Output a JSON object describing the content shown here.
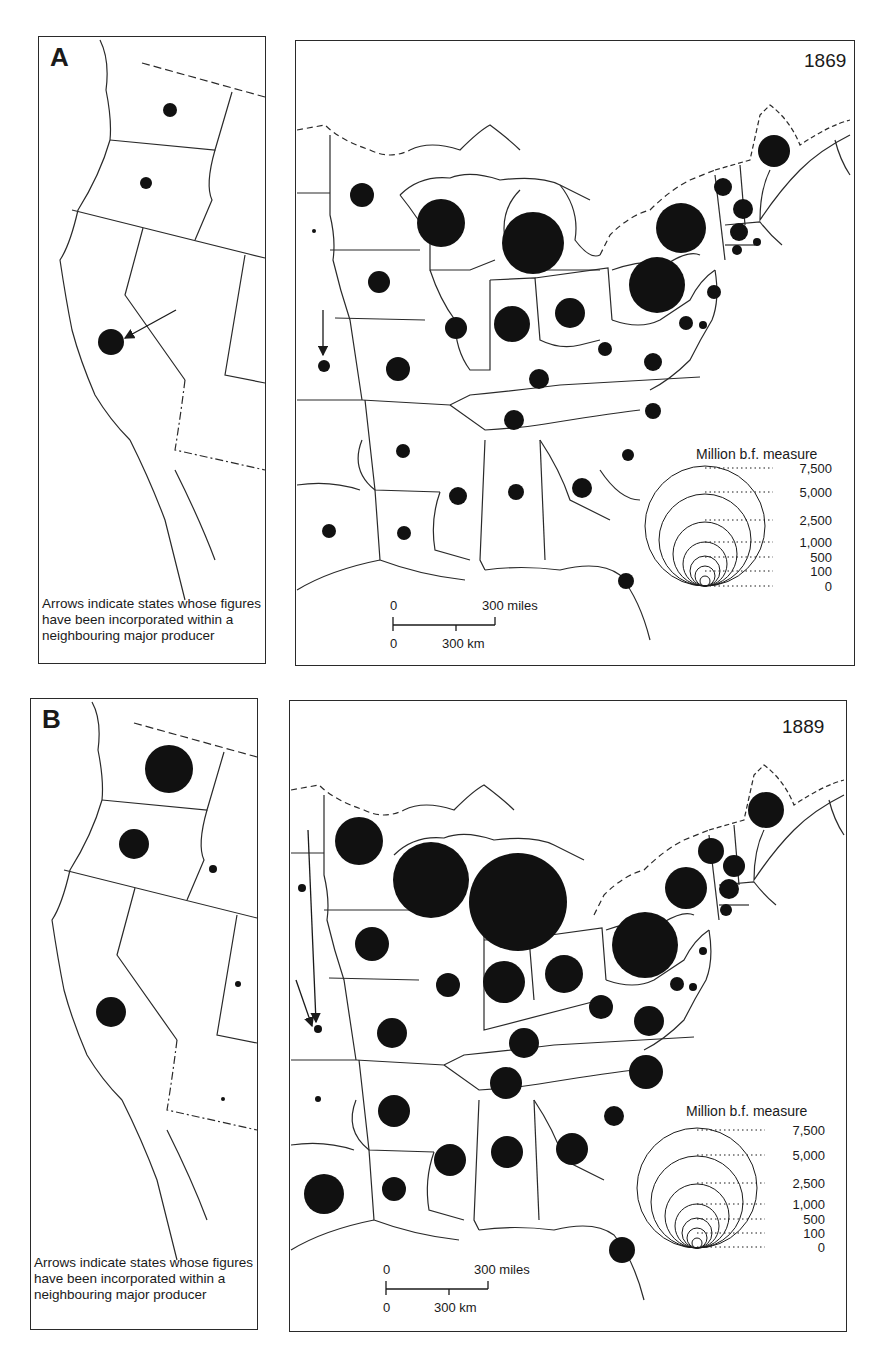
{
  "figure": {
    "panels": [
      {
        "letter": "A",
        "year": "1869",
        "note": "Arrows indicate states whose figures have been incorporated within a neighbouring major producer",
        "legend": {
          "title": "Million b.f. measure",
          "values": [
            "7,500",
            "5,000",
            "2,500",
            "1,000",
            "500",
            "100",
            "0"
          ]
        },
        "scale": {
          "miles_zero": "0",
          "miles_label": "300 miles",
          "km_zero": "0",
          "km_label": "300 km"
        },
        "west_circles": [
          {
            "state": "WA",
            "x": 170,
            "y": 110,
            "r": 7
          },
          {
            "state": "OR",
            "x": 146,
            "y": 183,
            "r": 6
          },
          {
            "state": "CA",
            "x": 111,
            "y": 342,
            "r": 13
          }
        ],
        "east_circles": [
          {
            "state": "DK",
            "x": 314,
            "y": 231,
            "r": 2
          },
          {
            "state": "MN",
            "x": 362,
            "y": 195,
            "r": 12
          },
          {
            "state": "WI",
            "x": 441,
            "y": 223,
            "r": 24
          },
          {
            "state": "MI",
            "x": 533,
            "y": 243,
            "r": 31
          },
          {
            "state": "IA",
            "x": 379,
            "y": 282,
            "r": 11
          },
          {
            "state": "IL",
            "x": 456,
            "y": 328,
            "r": 11
          },
          {
            "state": "IN",
            "x": 512,
            "y": 324,
            "r": 18
          },
          {
            "state": "OH",
            "x": 570,
            "y": 313,
            "r": 15
          },
          {
            "state": "NE",
            "x": 324,
            "y": 366,
            "r": 6
          },
          {
            "state": "MO",
            "x": 398,
            "y": 369,
            "r": 12
          },
          {
            "state": "KY",
            "x": 539,
            "y": 379,
            "r": 10
          },
          {
            "state": "WV",
            "x": 605,
            "y": 349,
            "r": 7
          },
          {
            "state": "VA",
            "x": 653,
            "y": 362,
            "r": 9
          },
          {
            "state": "TN",
            "x": 514,
            "y": 420,
            "r": 10
          },
          {
            "state": "NC",
            "x": 653,
            "y": 411,
            "r": 8
          },
          {
            "state": "AR",
            "x": 403,
            "y": 451,
            "r": 7
          },
          {
            "state": "SC",
            "x": 628,
            "y": 455,
            "r": 6
          },
          {
            "state": "MS",
            "x": 458,
            "y": 496,
            "r": 9
          },
          {
            "state": "AL",
            "x": 516,
            "y": 492,
            "r": 8
          },
          {
            "state": "GA",
            "x": 582,
            "y": 488,
            "r": 10
          },
          {
            "state": "TX",
            "x": 329,
            "y": 531,
            "r": 7
          },
          {
            "state": "LA",
            "x": 404,
            "y": 533,
            "r": 7
          },
          {
            "state": "FL",
            "x": 626,
            "y": 581,
            "r": 8
          },
          {
            "state": "NY",
            "x": 681,
            "y": 228,
            "r": 25
          },
          {
            "state": "PA",
            "x": 657,
            "y": 285,
            "r": 28
          },
          {
            "state": "ME",
            "x": 774,
            "y": 151,
            "r": 16
          },
          {
            "state": "VT",
            "x": 723,
            "y": 187,
            "r": 9
          },
          {
            "state": "NH",
            "x": 743,
            "y": 209,
            "r": 10
          },
          {
            "state": "MA",
            "x": 739,
            "y": 232,
            "r": 9
          },
          {
            "state": "CT",
            "x": 737,
            "y": 250,
            "r": 5
          },
          {
            "state": "RI",
            "x": 757,
            "y": 242,
            "r": 4
          },
          {
            "state": "NJ",
            "x": 714,
            "y": 292,
            "r": 7
          },
          {
            "state": "MD",
            "x": 686,
            "y": 323,
            "r": 7
          },
          {
            "state": "DE",
            "x": 703,
            "y": 325,
            "r": 4
          }
        ],
        "arrows": [
          {
            "x1": 176,
            "y1": 310,
            "x2": 125,
            "y2": 338
          },
          {
            "x1": 323,
            "y1": 310,
            "x2": 323,
            "y2": 355
          }
        ]
      },
      {
        "letter": "B",
        "year": "1889",
        "note": "Arrows indicate states whose figures have been incorporated within a neighbouring major producer",
        "legend": {
          "title": "Million b.f. measure",
          "values": [
            "7,500",
            "5,000",
            "2,500",
            "1,000",
            "500",
            "100",
            "0"
          ]
        },
        "scale": {
          "miles_zero": "0",
          "miles_label": "300 miles",
          "km_zero": "0",
          "km_label": "300 km"
        },
        "west_circles": [
          {
            "state": "WA",
            "x": 169,
            "y": 769,
            "r": 24
          },
          {
            "state": "OR",
            "x": 134,
            "y": 844,
            "r": 15
          },
          {
            "state": "ID",
            "x": 213,
            "y": 869,
            "r": 4
          },
          {
            "state": "CA",
            "x": 111,
            "y": 1012,
            "r": 15
          },
          {
            "state": "UT",
            "x": 238,
            "y": 984,
            "r": 3
          },
          {
            "state": "AZ",
            "x": 223,
            "y": 1099,
            "r": 2
          }
        ],
        "east_circles": [
          {
            "state": "DK",
            "x": 302,
            "y": 888,
            "r": 4
          },
          {
            "state": "MN",
            "x": 359,
            "y": 841,
            "r": 24
          },
          {
            "state": "WI",
            "x": 431,
            "y": 880,
            "r": 38
          },
          {
            "state": "MI",
            "x": 518,
            "y": 902,
            "r": 49
          },
          {
            "state": "IA",
            "x": 372,
            "y": 944,
            "r": 17
          },
          {
            "state": "IL",
            "x": 448,
            "y": 985,
            "r": 12
          },
          {
            "state": "IN",
            "x": 504,
            "y": 982,
            "r": 21
          },
          {
            "state": "OH",
            "x": 564,
            "y": 974,
            "r": 19
          },
          {
            "state": "NE",
            "x": 318,
            "y": 1029,
            "r": 4
          },
          {
            "state": "MO",
            "x": 392,
            "y": 1033,
            "r": 15
          },
          {
            "state": "KY",
            "x": 524,
            "y": 1043,
            "r": 15
          },
          {
            "state": "WV",
            "x": 601,
            "y": 1007,
            "r": 12
          },
          {
            "state": "VA",
            "x": 649,
            "y": 1021,
            "r": 15
          },
          {
            "state": "TN",
            "x": 506,
            "y": 1083,
            "r": 16
          },
          {
            "state": "NC",
            "x": 646,
            "y": 1072,
            "r": 17
          },
          {
            "state": "KS",
            "x": 318,
            "y": 1099,
            "r": 3
          },
          {
            "state": "AR",
            "x": 394,
            "y": 1111,
            "r": 16
          },
          {
            "state": "SC",
            "x": 614,
            "y": 1116,
            "r": 10
          },
          {
            "state": "MS",
            "x": 450,
            "y": 1160,
            "r": 16
          },
          {
            "state": "AL",
            "x": 507,
            "y": 1152,
            "r": 16
          },
          {
            "state": "GA",
            "x": 572,
            "y": 1149,
            "r": 16
          },
          {
            "state": "TX",
            "x": 324,
            "y": 1194,
            "r": 20
          },
          {
            "state": "LA",
            "x": 394,
            "y": 1189,
            "r": 12
          },
          {
            "state": "FL",
            "x": 622,
            "y": 1250,
            "r": 13
          },
          {
            "state": "NY",
            "x": 686,
            "y": 888,
            "r": 21
          },
          {
            "state": "PA",
            "x": 645,
            "y": 945,
            "r": 33
          },
          {
            "state": "ME",
            "x": 766,
            "y": 810,
            "r": 18
          },
          {
            "state": "VT",
            "x": 711,
            "y": 851,
            "r": 13
          },
          {
            "state": "NH",
            "x": 734,
            "y": 866,
            "r": 11
          },
          {
            "state": "MA",
            "x": 729,
            "y": 889,
            "r": 10
          },
          {
            "state": "CT",
            "x": 726,
            "y": 910,
            "r": 6
          },
          {
            "state": "NJ",
            "x": 703,
            "y": 951,
            "r": 4
          },
          {
            "state": "MD",
            "x": 677,
            "y": 984,
            "r": 7
          },
          {
            "state": "DE",
            "x": 693,
            "y": 987,
            "r": 4
          }
        ],
        "arrows": [
          {
            "x1": 308,
            "y1": 830,
            "x2": 316,
            "y2": 1022
          },
          {
            "x1": 296,
            "y1": 980,
            "x2": 312,
            "y2": 1026
          }
        ]
      }
    ]
  },
  "chart_data": {
    "type": "map-proportional-symbols",
    "unit": "Million b.f. measure",
    "legend_breaks": [
      0,
      100,
      500,
      1000,
      2500,
      5000,
      7500
    ],
    "panels": [
      "A: 1869",
      "B: 1889"
    ]
  }
}
